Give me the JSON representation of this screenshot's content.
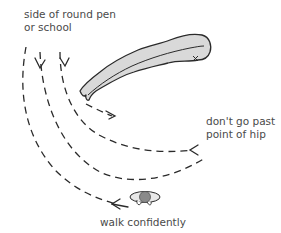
{
  "diagram": {
    "labels": {
      "side_of_pen": "side of round pen\nor school",
      "dont_go_past": "don't go past\npoint of hip",
      "walk_confidently": "walk confidently"
    },
    "elements": {
      "horse": "horse (top-down view)",
      "hip_marker": "x",
      "handler": "person (top-down view)"
    },
    "colors": {
      "ink": "#2a2a2a",
      "horse_fill": "#d9d9d9",
      "person_head": "#8a8a8a",
      "text": "#4a4a4a"
    }
  }
}
